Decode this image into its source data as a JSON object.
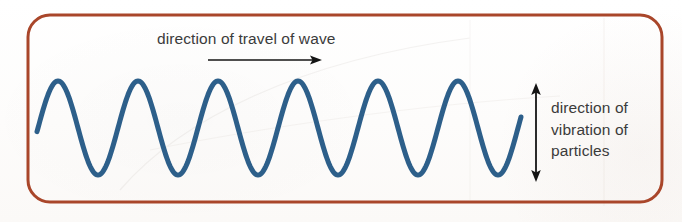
{
  "figure": {
    "name": "transverse-wave-diagram",
    "border_color": "#a9462a",
    "background_color": "#fefdfc",
    "wave_color": "#2d5f8a",
    "text_color": "#3b3b3b",
    "arrow_color": "#141414"
  },
  "labels": {
    "travel": "direction of travel of wave",
    "vibration_line1": "direction of",
    "vibration_line2": "vibration of",
    "vibration_line3": "particles"
  },
  "icons": {
    "travel_arrow": "arrow-right-icon",
    "vibration_arrow": "arrow-up-down-icon",
    "panel_border": "rounded-rectangle-border"
  },
  "chart_data": {
    "type": "line",
    "title": "direction of travel of wave",
    "xlabel": "",
    "ylabel": "",
    "grid": false,
    "legend": "none",
    "wave": {
      "shape": "sine",
      "cycles": 6,
      "wavelength_px": 80,
      "amplitude_px": 47,
      "baseline_y_px": 128,
      "crest_y_px": 81,
      "trough_y_px": 175,
      "start_x_px": 37,
      "end_x_px": 521,
      "stroke_width_px": 5,
      "crests_x_px": [
        58,
        138,
        218,
        298,
        378,
        458
      ],
      "troughs_x_px": [
        98,
        178,
        258,
        338,
        418,
        498
      ]
    },
    "annotations": [
      {
        "name": "travel-arrow",
        "text": "direction of travel of wave",
        "arrow": "horizontal-right",
        "x1_px": 208,
        "y1_px": 60,
        "x2_px": 322,
        "y2_px": 60
      },
      {
        "name": "vibration-arrow",
        "text": "direction of vibration of particles",
        "arrow": "vertical-double",
        "x1_px": 536,
        "y1_px": 84,
        "x2_px": 536,
        "y2_px": 181
      }
    ],
    "panel": {
      "x_px": 28,
      "y_px": 15,
      "width_px": 634,
      "height_px": 187,
      "corner_radius_px": 22
    }
  }
}
